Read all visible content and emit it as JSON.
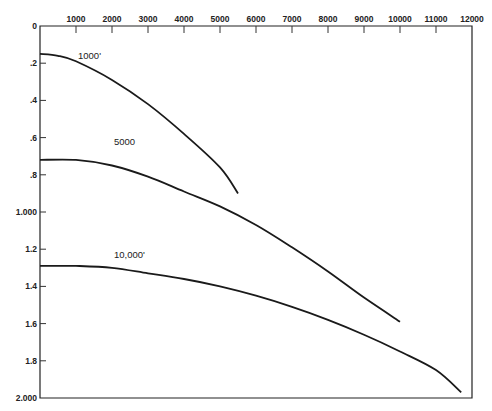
{
  "chart_data": {
    "type": "line",
    "title": "",
    "xlabel": "",
    "ylabel": "",
    "xlim": [
      0,
      12000
    ],
    "ylim": [
      0,
      2.0
    ],
    "y_inverted": true,
    "x_axis_position": "top",
    "grid": false,
    "legend": "inline curve labels",
    "x_ticks": [
      1000,
      2000,
      3000,
      4000,
      5000,
      6000,
      7000,
      8000,
      9000,
      10000,
      11000,
      12000
    ],
    "x_tick_labels": [
      "1000",
      "2000",
      "3000",
      "4000",
      "5000",
      "6000",
      "7000",
      "8000",
      "9000",
      "10000",
      "11000",
      "12000"
    ],
    "y_ticks": [
      0,
      0.2,
      0.4,
      0.6,
      0.8,
      1.0,
      1.2,
      1.4,
      1.6,
      1.8,
      2.0
    ],
    "y_tick_labels": [
      "0",
      ".2",
      ".4",
      ".6",
      ".8",
      "1.000",
      "1.2",
      "1.4",
      "1.6",
      "1.8",
      "2.000"
    ],
    "series": [
      {
        "name": "1000'",
        "x": [
          0,
          500,
          1000,
          2000,
          3000,
          4000,
          5000,
          5500
        ],
        "y": [
          0.15,
          0.16,
          0.19,
          0.29,
          0.42,
          0.58,
          0.76,
          0.9
        ]
      },
      {
        "name": "5000",
        "x": [
          0,
          1000,
          2000,
          3000,
          4000,
          5000,
          6000,
          7000,
          8000,
          9000,
          10000
        ],
        "y": [
          0.72,
          0.72,
          0.75,
          0.81,
          0.89,
          0.97,
          1.07,
          1.19,
          1.32,
          1.46,
          1.59
        ]
      },
      {
        "name": "10,000'",
        "x": [
          0,
          1000,
          2000,
          3000,
          4000,
          5000,
          6000,
          7000,
          8000,
          9000,
          10000,
          11000,
          11700
        ],
        "y": [
          1.29,
          1.29,
          1.3,
          1.33,
          1.36,
          1.4,
          1.45,
          1.51,
          1.58,
          1.66,
          1.75,
          1.85,
          1.97
        ]
      }
    ],
    "annotations": [
      {
        "text": "1000'",
        "x": 1000,
        "y": 0.19
      },
      {
        "text": "5000",
        "x": 2000,
        "y": 0.65
      },
      {
        "text": "10,000'",
        "x": 2000,
        "y": 1.26
      }
    ]
  }
}
